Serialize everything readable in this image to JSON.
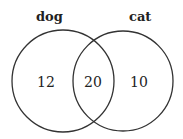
{
  "diagram": {
    "type": "venn",
    "sets": [
      {
        "label": "dog",
        "only_value": "12"
      },
      {
        "label": "cat",
        "only_value": "10"
      }
    ],
    "intersection_value": "20",
    "stroke_color": "#333333"
  }
}
